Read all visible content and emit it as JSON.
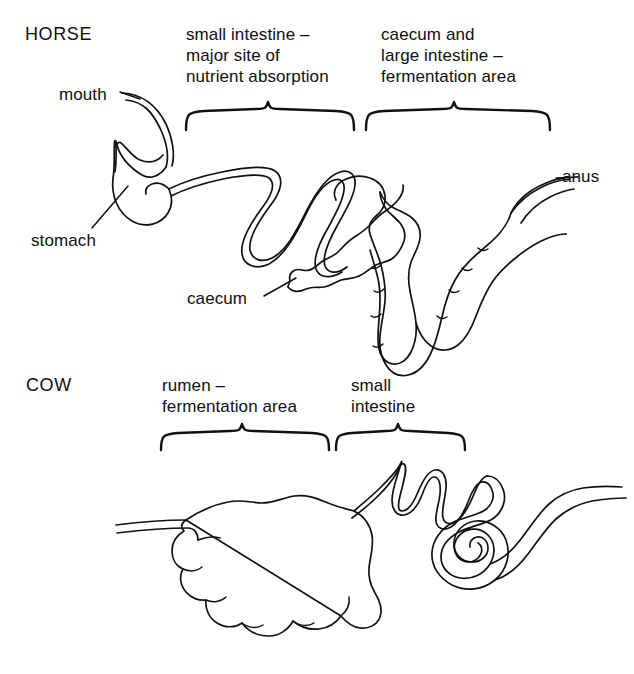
{
  "figure": {
    "background_color": "#ffffff",
    "line_color": "#111111",
    "text_color": "#101010"
  },
  "horse": {
    "animal_label": "HORSE",
    "brace_labels": [
      {
        "id": "small-intestine",
        "text": "small intestine –\nmajor site of\nnutrient absorption"
      },
      {
        "id": "caecum-large-intestine",
        "text": "caecum and\nlarge intestine –\nfermentation area"
      }
    ],
    "part_labels": [
      {
        "id": "mouth",
        "text": "mouth"
      },
      {
        "id": "stomach",
        "text": "stomach"
      },
      {
        "id": "caecum",
        "text": "caecum"
      },
      {
        "id": "anus",
        "text": "anus"
      }
    ]
  },
  "cow": {
    "animal_label": "COW",
    "brace_labels": [
      {
        "id": "rumen",
        "text": "rumen –\nfermentation area"
      },
      {
        "id": "small-intestine",
        "text": "small\nintestine"
      }
    ],
    "part_labels": []
  }
}
